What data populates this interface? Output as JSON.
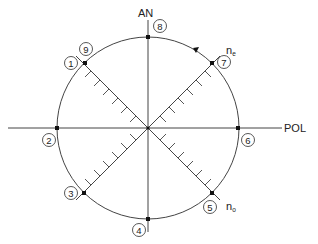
{
  "diagram": {
    "type": "polar-rotation-diagram",
    "axes": {
      "vertical_label": "AN",
      "horizontal_label": "POL"
    },
    "birefringence_axes": [
      {
        "symbol": "n",
        "subscript": "e",
        "position": "upper-right"
      },
      {
        "symbol": "n",
        "subscript": "o",
        "position": "lower-right"
      }
    ],
    "positions": [
      {
        "id": 1,
        "label": "1",
        "location": "upper-left diagonal"
      },
      {
        "id": 2,
        "label": "2",
        "location": "left (POL axis)"
      },
      {
        "id": 3,
        "label": "3",
        "location": "lower-left diagonal"
      },
      {
        "id": 4,
        "label": "4",
        "location": "bottom (AN axis)"
      },
      {
        "id": 5,
        "label": "5",
        "location": "lower-right diagonal"
      },
      {
        "id": 6,
        "label": "6",
        "location": "right (POL axis)"
      },
      {
        "id": 7,
        "label": "7",
        "location": "upper-right diagonal"
      },
      {
        "id": 8,
        "label": "8",
        "location": "top (AN axis)"
      },
      {
        "id": 9,
        "label": "9",
        "location": "upper-left diagonal"
      }
    ],
    "rotation_arrow": "clockwise, on arc between 8 and 7",
    "ticks_per_diagonal_arm": 6,
    "colors": {
      "line": "#333333",
      "background": "#ffffff"
    }
  }
}
